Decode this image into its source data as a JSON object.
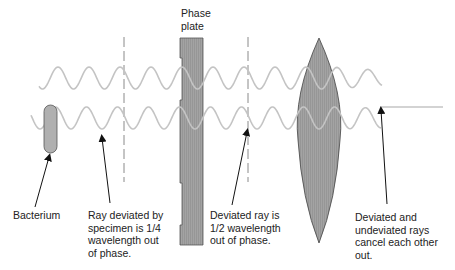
{
  "diagram": {
    "colors": {
      "wave": "#c4c4c4",
      "plate_fill": "#9a9a9a",
      "lens_fill": "#a8a8a8",
      "outline": "#555555",
      "dash": "#8a8a8a",
      "arrow": "#111111",
      "text": "#222222"
    },
    "labels": {
      "phase_plate": "Phase\nplate",
      "bacterium": "Bacterium",
      "quarter_wave": "Ray deviated by\nspecimen is 1/4\nwavelength out\nof phase.",
      "half_wave": "Deviated ray is\n1/2 wavelength\nout of phase.",
      "cancel": "Deviated and\nundeviated rays\ncancel each other\nout."
    },
    "components": [
      {
        "name": "bacterium",
        "type": "specimen"
      },
      {
        "name": "phase-plate",
        "type": "optical-element"
      },
      {
        "name": "lens",
        "type": "objective-lens"
      }
    ],
    "rays": [
      {
        "name": "undeviated-ray",
        "position": "top"
      },
      {
        "name": "deviated-ray",
        "position": "bottom"
      }
    ],
    "caption": ""
  }
}
